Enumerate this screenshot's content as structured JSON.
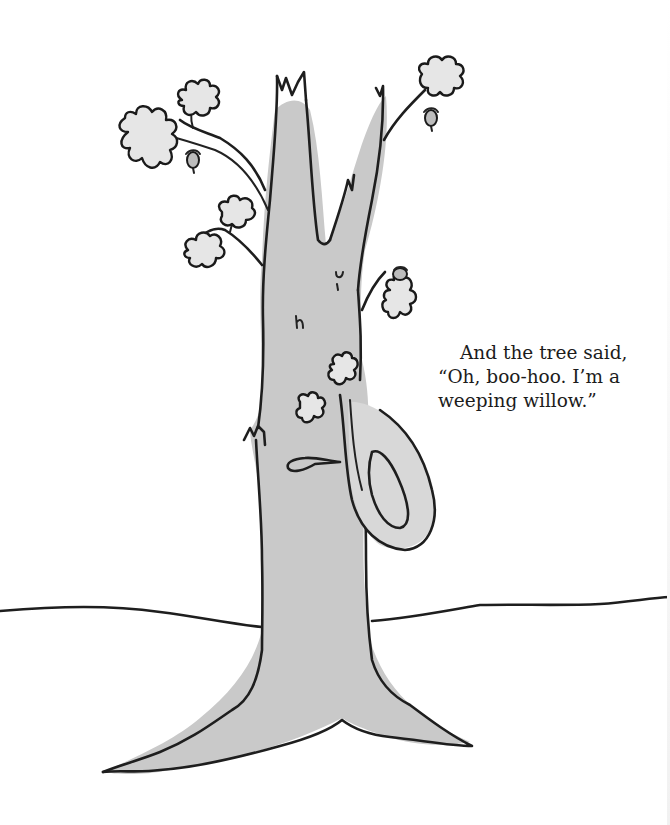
{
  "page": {
    "type": "picture-book page",
    "background_color": "#ffffff"
  },
  "caption": {
    "lines": [
      "And the tree said,",
      "“Oh, boo-hoo. I’m a",
      "weeping willow.”"
    ],
    "text_color": "#1c1c1c"
  },
  "illustration": {
    "subject": "oak tree with a face and a branch looped like a handkerchief, standing on a ground line",
    "elements": [
      "trunk",
      "branches",
      "oak-leaves",
      "acorns",
      "face",
      "looped-branch",
      "ground-line",
      "roots"
    ],
    "colors": {
      "ink": "#1e1e1e",
      "wash": "#c9c9c9",
      "leaf_fill": "#e6e6e6"
    }
  }
}
